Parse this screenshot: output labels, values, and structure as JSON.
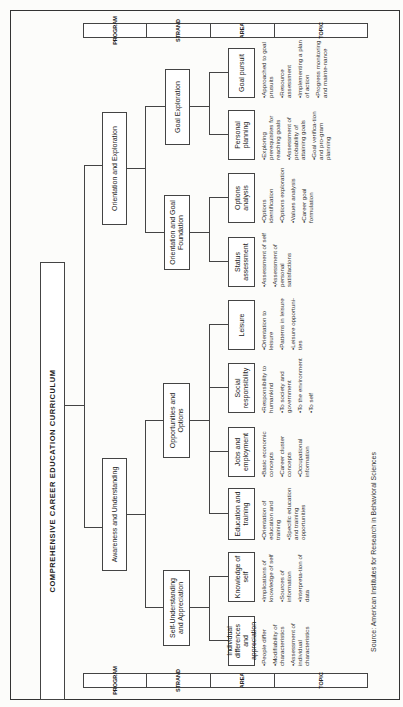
{
  "title": "COMPREHENSIVE CAREER EDUCATION CURRICULUM",
  "level_headers": [
    "PROGRAM",
    "STRAND",
    "AREA",
    "TOPIC"
  ],
  "programs": [
    {
      "label": "Awareness and Understanding"
    },
    {
      "label": "Orientation and Exploration"
    }
  ],
  "strands": [
    {
      "label": "Self-Understanding and Appreciation"
    },
    {
      "label": "Opportunities and Options"
    },
    {
      "label": "Orientation and Goal Foundation"
    },
    {
      "label": "Goal Exploration"
    }
  ],
  "areas": [
    {
      "label": "Individual differences and appreciation",
      "topics": [
        "•People differ",
        "•Modifiability of characteristics",
        "•Assessment of individual characteristics"
      ]
    },
    {
      "label": "Knowledge of self",
      "topics": [
        "•Implications of knowledge of self",
        "•Sources of information",
        "•Interpreta-tion of data"
      ]
    },
    {
      "label": "Education and training",
      "topics": [
        "•Orientation of education and training",
        "•Specific education and training opportunities"
      ]
    },
    {
      "label": "Jobs and employment",
      "topics": [
        "•Basic economic concepts",
        "•Career cluster concepts",
        "•Occupational information"
      ]
    },
    {
      "label": "Social responsibility",
      "topics": [
        "•Responsibility to humankind",
        "•To society and government",
        "•To the environment",
        "•To self"
      ]
    },
    {
      "label": "Leisure",
      "topics": [
        "•Orientation to leisure",
        "•Patterns in leisure",
        "•Leisure opportuni-ties"
      ]
    },
    {
      "label": "Status assessment",
      "topics": [
        "•Assessment of self",
        "•Assessment of personal satisfactions"
      ]
    },
    {
      "label": "Options analysis",
      "topics": [
        "•Options identification",
        "•Options exploration",
        "•Values analysis",
        "•Career goal formulation"
      ]
    },
    {
      "label": "Personal planning",
      "topics": [
        "•Exploring prerequisites for reaching goals",
        "•Assessment of probability of attaining goals",
        "•Goal verifica-tion and pro-gram planning"
      ]
    },
    {
      "label": "Goal pursuit",
      "topics": [
        "•Approached to goal prusuits",
        "•Resource assessment",
        "•Implementing a plan of action",
        "•Progress monitoring and mainte-nance"
      ]
    }
  ],
  "source": "Source: American Institutes for Research in Behavioral Sciences"
}
